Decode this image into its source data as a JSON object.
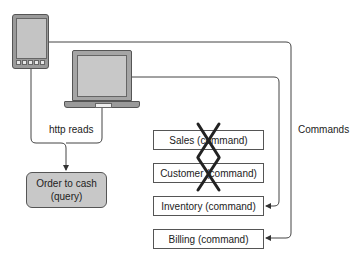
{
  "devices": {
    "tablet": "tablet-device",
    "laptop": "laptop-device"
  },
  "labels": {
    "http_reads": "http reads",
    "commands": "Commands"
  },
  "query_box": {
    "line1": "Order to cash",
    "line2": "(query)"
  },
  "command_boxes": [
    {
      "label": "Sales (command)",
      "crossed": true
    },
    {
      "label": "Customer (command)",
      "crossed": true
    },
    {
      "label": "Inventory (command)",
      "crossed": false
    },
    {
      "label": "Billing (command)",
      "crossed": false
    }
  ],
  "colors": {
    "line": "#444444",
    "device_fill": "#9a9a9a",
    "query_fill": "#c8c8c8",
    "cross": "#222222"
  }
}
